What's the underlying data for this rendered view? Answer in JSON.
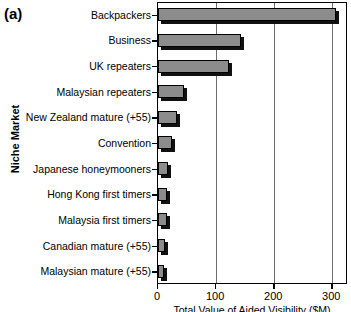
{
  "figure": {
    "panel_tag": "(a)",
    "ylabel": "Niche Market",
    "xlabel": "Total Value of Aided Visibility ($M)"
  },
  "xaxis": {
    "ticks": [
      {
        "value": 0,
        "label": "0"
      },
      {
        "value": 100,
        "label": "100"
      },
      {
        "value": 200,
        "label": "200"
      },
      {
        "value": 300,
        "label": "300"
      }
    ]
  },
  "chart_data": {
    "type": "bar",
    "orientation": "horizontal",
    "title": "(a)",
    "xlabel": "Total Value of Aided Visibility ($M)",
    "ylabel": "Niche Market",
    "xlim": [
      0,
      327
    ],
    "grid": true,
    "legend": null,
    "bar_color": "#8c8c8c",
    "categories": [
      "Backpackers",
      "Business",
      "UK repeaters",
      "Malaysian repeaters",
      "New Zealand mature (+55)",
      "Convention",
      "Japanese honeymooners",
      "Hong Kong first timers",
      "Malaysia first timers",
      "Canadian mature (+55)",
      "Malaysian mature (+55)"
    ],
    "values": [
      307,
      143,
      122,
      45,
      33,
      24,
      17,
      15,
      15,
      12,
      10
    ]
  }
}
